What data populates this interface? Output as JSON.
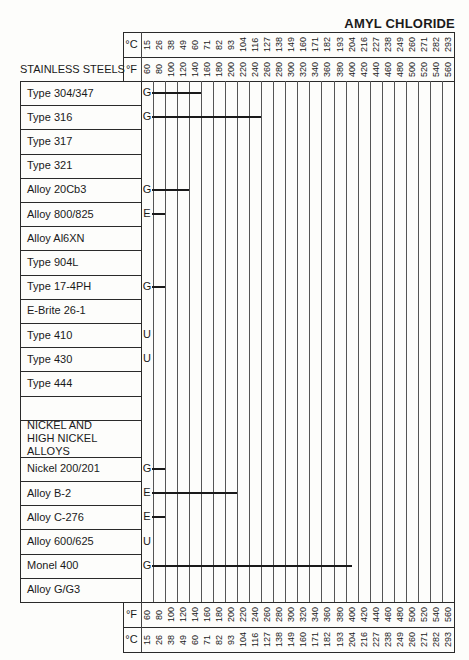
{
  "title": "AMYL CHLORIDE",
  "section_header": "STAINLESS STEELS",
  "units": {
    "c": "°C",
    "f": "°F"
  },
  "chart_data": {
    "type": "range-bar",
    "title": "AMYL CHLORIDE",
    "x_axis_F": [
      60,
      80,
      100,
      120,
      140,
      160,
      180,
      200,
      220,
      240,
      260,
      280,
      300,
      320,
      340,
      360,
      380,
      400,
      420,
      440,
      460,
      480,
      500,
      520,
      540,
      560
    ],
    "x_axis_C": [
      15,
      26,
      38,
      49,
      60,
      71,
      82,
      93,
      104,
      116,
      127,
      138,
      149,
      160,
      171,
      182,
      193,
      204,
      216,
      227,
      238,
      249,
      260,
      271,
      282,
      293
    ],
    "rating_legend": [
      "E",
      "G",
      "U"
    ],
    "rows": [
      {
        "material": "Type 304/347",
        "rating": "G",
        "bar_start_F": 70,
        "bar_end_F": 150
      },
      {
        "material": "Type 316",
        "rating": "G",
        "bar_start_F": 70,
        "bar_end_F": 250
      },
      {
        "material": "Type 317",
        "rating": "",
        "bar_start_F": null,
        "bar_end_F": null
      },
      {
        "material": "Type 321",
        "rating": "",
        "bar_start_F": null,
        "bar_end_F": null
      },
      {
        "material": "Alloy 20Cb3",
        "rating": "G",
        "bar_start_F": 70,
        "bar_end_F": 130
      },
      {
        "material": "Alloy 800/825",
        "rating": "E",
        "bar_start_F": 70,
        "bar_end_F": 90
      },
      {
        "material": "Alloy Al6XN",
        "rating": "",
        "bar_start_F": null,
        "bar_end_F": null
      },
      {
        "material": "Type 904L",
        "rating": "",
        "bar_start_F": null,
        "bar_end_F": null
      },
      {
        "material": "Type 17-4PH",
        "rating": "G",
        "bar_start_F": 70,
        "bar_end_F": 90
      },
      {
        "material": "E-Brite 26-1",
        "rating": "",
        "bar_start_F": null,
        "bar_end_F": null
      },
      {
        "material": "Type 410",
        "rating": "U",
        "bar_start_F": null,
        "bar_end_F": null
      },
      {
        "material": "Type 430",
        "rating": "U",
        "bar_start_F": null,
        "bar_end_F": null
      },
      {
        "material": "Type 444",
        "rating": "",
        "bar_start_F": null,
        "bar_end_F": null
      },
      {
        "material": "",
        "rating": "",
        "bar_start_F": null,
        "bar_end_F": null
      },
      {
        "material": "NICKEL AND HIGH NICKEL ALLOYS",
        "section": true,
        "rating": "",
        "bar_start_F": null,
        "bar_end_F": null
      },
      {
        "material": "Nickel 200/201",
        "rating": "G",
        "bar_start_F": 70,
        "bar_end_F": 90
      },
      {
        "material": "Alloy B-2",
        "rating": "E",
        "bar_start_F": 70,
        "bar_end_F": 210
      },
      {
        "material": "Alloy C-276",
        "rating": "E",
        "bar_start_F": 70,
        "bar_end_F": 90
      },
      {
        "material": "Alloy 600/625",
        "rating": "U",
        "bar_start_F": null,
        "bar_end_F": null
      },
      {
        "material": "Monel 400",
        "rating": "G",
        "bar_start_F": 70,
        "bar_end_F": 400
      },
      {
        "material": "Alloy G/G3",
        "rating": "",
        "bar_start_F": null,
        "bar_end_F": null
      }
    ],
    "xlabel": "Temperature (°F / °C)",
    "grid": true
  },
  "colors": {
    "ink": "#1a1a1a",
    "background": "#fdfdfb"
  }
}
